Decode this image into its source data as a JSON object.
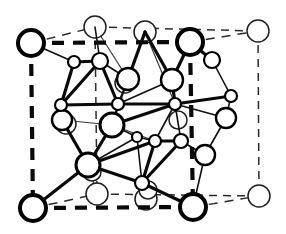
{
  "figure": {
    "background_color": "#ffffff",
    "line_color": "#000000",
    "atom_fill_color": "#ffffff",
    "canvas": {
      "width": 286,
      "height": 234
    }
  },
  "cell": {
    "front_face_corners": [
      {
        "name": "corner-top-left",
        "x": 31,
        "y": 43,
        "r": 13
      },
      {
        "name": "corner-top-right",
        "x": 190,
        "y": 42,
        "r": 13
      },
      {
        "name": "corner-bottom-left",
        "x": 33,
        "y": 208,
        "r": 13
      },
      {
        "name": "corner-bottom-right",
        "x": 193,
        "y": 207,
        "r": 13
      }
    ],
    "back_face_corners": [
      {
        "name": "back-corner-top-left",
        "x": 95,
        "y": 27,
        "r": 11
      },
      {
        "name": "back-corner-top-right",
        "x": 258,
        "y": 31,
        "r": 11
      },
      {
        "name": "back-corner-bottom-left",
        "x": 97,
        "y": 194,
        "r": 11
      },
      {
        "name": "back-corner-bottom-right",
        "x": 259,
        "y": 196,
        "r": 11
      }
    ],
    "front_edges": [
      {
        "name": "edge-top-front",
        "x1": 31,
        "y1": 43,
        "x2": 190,
        "y2": 42,
        "dash": "12 9"
      },
      {
        "name": "edge-left-front",
        "x1": 31,
        "y1": 43,
        "x2": 33,
        "y2": 208,
        "dash": "12 9"
      },
      {
        "name": "edge-right-front",
        "x1": 190,
        "y1": 42,
        "x2": 193,
        "y2": 207,
        "dash": "12 9"
      },
      {
        "name": "edge-bottom-front",
        "x1": 33,
        "y1": 208,
        "x2": 193,
        "y2": 207,
        "dash": "12 9"
      }
    ],
    "back_edges": [
      {
        "name": "edge-top-back",
        "x1": 95,
        "y1": 27,
        "x2": 258,
        "y2": 31,
        "dash": "8 6"
      },
      {
        "name": "edge-right-back",
        "x1": 258,
        "y1": 31,
        "x2": 259,
        "y2": 196,
        "dash": "8 6"
      },
      {
        "name": "edge-bottom-back",
        "x1": 97,
        "y1": 194,
        "x2": 259,
        "y2": 196,
        "dash": "8 6"
      },
      {
        "name": "edge-left-back",
        "x1": 95,
        "y1": 27,
        "x2": 97,
        "y2": 194,
        "dash": "8 6"
      },
      {
        "name": "edge-depth-top-left",
        "x1": 31,
        "y1": 43,
        "x2": 95,
        "y2": 27,
        "dash": "9 7"
      },
      {
        "name": "edge-depth-top-right",
        "x1": 190,
        "y1": 42,
        "x2": 258,
        "y2": 31,
        "dash": "9 7"
      },
      {
        "name": "edge-depth-bottom-left",
        "x1": 33,
        "y1": 208,
        "x2": 97,
        "y2": 194,
        "dash": "9 7"
      },
      {
        "name": "edge-depth-bottom-right",
        "x1": 193,
        "y1": 207,
        "x2": 259,
        "y2": 196,
        "dash": "9 7"
      }
    ]
  },
  "atoms": {
    "top_back_face": [
      {
        "name": "atom-back-top-mid-a",
        "x": 145,
        "y": 32,
        "r": 11,
        "style": "back"
      },
      {
        "name": "atom-back-bottom-mid-a",
        "x": 146,
        "y": 199,
        "r": 11,
        "style": "back"
      }
    ],
    "large": [
      {
        "name": "atom-large-center-left",
        "x": 112,
        "y": 125,
        "r": 12,
        "style": "large"
      },
      {
        "name": "atom-large-upper-mid",
        "x": 128,
        "y": 79,
        "r": 11,
        "style": "medium"
      },
      {
        "name": "atom-large-upper-right",
        "x": 172,
        "y": 80,
        "r": 11,
        "style": "medium"
      },
      {
        "name": "atom-large-lower-left",
        "x": 88,
        "y": 165,
        "r": 12,
        "style": "large"
      },
      {
        "name": "atom-large-upper-left-cluster",
        "x": 100,
        "y": 61,
        "r": 8,
        "style": "small"
      }
    ],
    "medium": [
      {
        "name": "atom-mid-left",
        "x": 62,
        "y": 120,
        "r": 10,
        "style": "medium"
      },
      {
        "name": "atom-mid-right-upper",
        "x": 226,
        "y": 118,
        "r": 10,
        "style": "medium"
      },
      {
        "name": "atom-mid-right-lower",
        "x": 205,
        "y": 155,
        "r": 10,
        "style": "medium"
      },
      {
        "name": "atom-mid-right-top",
        "x": 212,
        "y": 60,
        "r": 8,
        "style": "small"
      }
    ],
    "small": [
      {
        "name": "atom-small-cluster-tl",
        "x": 74,
        "y": 62,
        "r": 6,
        "style": "small"
      },
      {
        "name": "atom-small-cluster-bl",
        "x": 61,
        "y": 105,
        "r": 6,
        "style": "small"
      },
      {
        "name": "atom-small-cluster-br",
        "x": 118,
        "y": 104,
        "r": 6,
        "style": "small"
      },
      {
        "name": "atom-small-center",
        "x": 175,
        "y": 104,
        "r": 6,
        "style": "small"
      },
      {
        "name": "atom-small-right-cluster",
        "x": 231,
        "y": 96,
        "r": 6,
        "style": "small"
      },
      {
        "name": "atom-small-lower-center-a",
        "x": 155,
        "y": 141,
        "r": 6,
        "style": "small"
      },
      {
        "name": "atom-small-lower-center-b",
        "x": 181,
        "y": 141,
        "r": 7,
        "style": "small"
      },
      {
        "name": "atom-small-bottom-center",
        "x": 142,
        "y": 183,
        "r": 7,
        "style": "small"
      },
      {
        "name": "atom-small-center-dot",
        "x": 137,
        "y": 137,
        "r": 5,
        "style": "small"
      }
    ],
    "faint_back": [
      {
        "name": "atom-faint-upper-left",
        "x": 66,
        "y": 124,
        "r": 10,
        "style": "back"
      },
      {
        "name": "atom-faint-center-upper",
        "x": 125,
        "y": 83,
        "r": 10,
        "style": "back"
      },
      {
        "name": "atom-faint-lower",
        "x": 92,
        "y": 172,
        "r": 9,
        "style": "back"
      },
      {
        "name": "atom-faint-right",
        "x": 178,
        "y": 120,
        "r": 9,
        "style": "back"
      },
      {
        "name": "atom-faint-bottom-right",
        "x": 148,
        "y": 190,
        "r": 9,
        "style": "back"
      }
    ]
  },
  "bonds": {
    "major": [
      {
        "name": "bond-cluster-tl-1",
        "x1": 74,
        "y1": 62,
        "x2": 100,
        "y2": 61
      },
      {
        "name": "bond-cluster-tl-2",
        "x1": 74,
        "y1": 62,
        "x2": 61,
        "y2": 105
      },
      {
        "name": "bond-cluster-tl-3",
        "x1": 100,
        "y1": 61,
        "x2": 61,
        "y2": 105
      },
      {
        "name": "bond-cluster-tl-4",
        "x1": 100,
        "y1": 61,
        "x2": 118,
        "y2": 104
      },
      {
        "name": "bond-cluster-tl-5",
        "x1": 61,
        "y1": 105,
        "x2": 118,
        "y2": 104
      },
      {
        "name": "bond-center-1",
        "x1": 118,
        "y1": 104,
        "x2": 175,
        "y2": 104
      },
      {
        "name": "bond-center-2",
        "x1": 172,
        "y1": 80,
        "x2": 175,
        "y2": 104
      },
      {
        "name": "bond-center-3",
        "x1": 190,
        "y1": 42,
        "x2": 172,
        "y2": 80
      },
      {
        "name": "bond-center-4",
        "x1": 128,
        "y1": 79,
        "x2": 145,
        "y2": 32
      },
      {
        "name": "bond-center-5",
        "x1": 145,
        "y1": 32,
        "x2": 172,
        "y2": 80
      },
      {
        "name": "bond-center-6",
        "x1": 112,
        "y1": 125,
        "x2": 175,
        "y2": 104
      },
      {
        "name": "bond-center-7",
        "x1": 112,
        "y1": 125,
        "x2": 88,
        "y2": 165
      },
      {
        "name": "bond-lower-1",
        "x1": 88,
        "y1": 165,
        "x2": 33,
        "y2": 208
      },
      {
        "name": "bond-lower-2",
        "x1": 88,
        "y1": 165,
        "x2": 62,
        "y2": 120
      },
      {
        "name": "bond-lower-3",
        "x1": 88,
        "y1": 165,
        "x2": 142,
        "y2": 183
      },
      {
        "name": "bond-lower-4",
        "x1": 88,
        "y1": 165,
        "x2": 155,
        "y2": 141
      },
      {
        "name": "bond-lower-5",
        "x1": 155,
        "y1": 141,
        "x2": 181,
        "y2": 141
      },
      {
        "name": "bond-lower-6",
        "x1": 181,
        "y1": 141,
        "x2": 142,
        "y2": 183
      },
      {
        "name": "bond-lower-7",
        "x1": 155,
        "y1": 141,
        "x2": 142,
        "y2": 183
      },
      {
        "name": "bond-lower-8",
        "x1": 142,
        "y1": 183,
        "x2": 193,
        "y2": 207
      },
      {
        "name": "bond-upper-right-1",
        "x1": 190,
        "y1": 42,
        "x2": 212,
        "y2": 60
      },
      {
        "name": "bond-right-1",
        "x1": 175,
        "y1": 104,
        "x2": 231,
        "y2": 96
      }
    ],
    "minor": [
      {
        "name": "bond-m-1",
        "x1": 31,
        "y1": 43,
        "x2": 74,
        "y2": 62
      },
      {
        "name": "bond-m-2",
        "x1": 95,
        "y1": 27,
        "x2": 100,
        "y2": 61
      },
      {
        "name": "bond-m-3",
        "x1": 128,
        "y1": 79,
        "x2": 118,
        "y2": 104
      },
      {
        "name": "bond-m-4",
        "x1": 128,
        "y1": 79,
        "x2": 112,
        "y2": 125
      },
      {
        "name": "bond-m-5",
        "x1": 172,
        "y1": 80,
        "x2": 190,
        "y2": 42
      },
      {
        "name": "bond-m-6",
        "x1": 212,
        "y1": 60,
        "x2": 231,
        "y2": 96
      },
      {
        "name": "bond-m-7",
        "x1": 212,
        "y1": 60,
        "x2": 190,
        "y2": 42
      },
      {
        "name": "bond-m-8",
        "x1": 231,
        "y1": 96,
        "x2": 226,
        "y2": 118
      },
      {
        "name": "bond-m-9",
        "x1": 226,
        "y1": 118,
        "x2": 205,
        "y2": 155
      },
      {
        "name": "bond-m-10",
        "x1": 205,
        "y1": 155,
        "x2": 181,
        "y2": 141
      },
      {
        "name": "bond-m-11",
        "x1": 205,
        "y1": 155,
        "x2": 193,
        "y2": 207
      },
      {
        "name": "bond-m-12",
        "x1": 62,
        "y1": 120,
        "x2": 61,
        "y2": 105
      },
      {
        "name": "bond-m-13",
        "x1": 175,
        "y1": 104,
        "x2": 181,
        "y2": 141
      },
      {
        "name": "bond-m-14",
        "x1": 175,
        "y1": 104,
        "x2": 155,
        "y2": 141
      },
      {
        "name": "bond-m-15",
        "x1": 112,
        "y1": 125,
        "x2": 137,
        "y2": 137
      },
      {
        "name": "bond-m-16",
        "x1": 137,
        "y1": 137,
        "x2": 155,
        "y2": 141
      },
      {
        "name": "bond-m-17",
        "x1": 137,
        "y1": 137,
        "x2": 142,
        "y2": 183
      },
      {
        "name": "bond-m-18",
        "x1": 118,
        "y1": 104,
        "x2": 112,
        "y2": 125
      },
      {
        "name": "bond-m-19",
        "x1": 100,
        "y1": 61,
        "x2": 128,
        "y2": 79
      },
      {
        "name": "bond-m-20",
        "x1": 118,
        "y1": 104,
        "x2": 172,
        "y2": 80
      },
      {
        "name": "bond-m-21",
        "x1": 175,
        "y1": 104,
        "x2": 226,
        "y2": 118
      },
      {
        "name": "bond-m-22",
        "x1": 88,
        "y1": 165,
        "x2": 137,
        "y2": 137
      }
    ],
    "faint": [
      {
        "name": "bond-f-1",
        "x1": 95,
        "y1": 27,
        "x2": 128,
        "y2": 79
      },
      {
        "name": "bond-f-2",
        "x1": 97,
        "y1": 194,
        "x2": 88,
        "y2": 165
      },
      {
        "name": "bond-f-3",
        "x1": 145,
        "y1": 32,
        "x2": 175,
        "y2": 104
      },
      {
        "name": "bond-f-4",
        "x1": 146,
        "y1": 199,
        "x2": 142,
        "y2": 183
      },
      {
        "name": "bond-f-5",
        "x1": 66,
        "y1": 124,
        "x2": 61,
        "y2": 105
      },
      {
        "name": "bond-f-6",
        "x1": 178,
        "y1": 120,
        "x2": 175,
        "y2": 104
      },
      {
        "name": "bond-f-7",
        "x1": 112,
        "y1": 125,
        "x2": 155,
        "y2": 141
      },
      {
        "name": "bond-f-8",
        "x1": 62,
        "y1": 120,
        "x2": 112,
        "y2": 125
      }
    ]
  }
}
